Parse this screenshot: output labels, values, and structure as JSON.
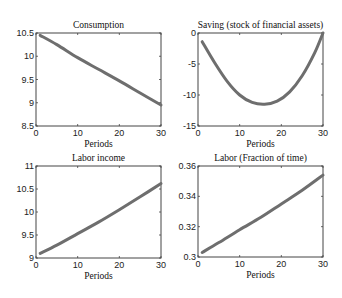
{
  "chart_data": [
    {
      "type": "line",
      "title": "Consumption",
      "xlabel": "Periods",
      "ylabel": "",
      "xlim": [
        0,
        30
      ],
      "ylim": [
        8.5,
        10.5
      ],
      "xticks": [
        0,
        10,
        20,
        30
      ],
      "yticks": [
        8.5,
        9,
        9.5,
        10,
        10.5
      ],
      "ytick_labels": [
        "8.5",
        "9",
        "9.5",
        "10",
        "10.5"
      ],
      "x": [
        1,
        5,
        10,
        15,
        20,
        25,
        30
      ],
      "values": [
        10.45,
        10.25,
        9.97,
        9.72,
        9.47,
        9.21,
        8.95
      ],
      "box": [
        36,
        33,
        161,
        126
      ]
    },
    {
      "type": "line",
      "title": "Saving (stock of financial assets)",
      "xlabel": "Periods",
      "ylabel": "",
      "xlim": [
        0,
        30
      ],
      "ylim": [
        -15,
        0
      ],
      "xticks": [
        0,
        10,
        20,
        30
      ],
      "yticks": [
        -15,
        -10,
        -5,
        0
      ],
      "ytick_labels": [
        "-15",
        "-10",
        "-5",
        "0"
      ],
      "x": [
        1,
        4,
        7,
        10,
        13,
        16,
        19,
        22,
        25,
        28,
        30
      ],
      "values": [
        -1.4,
        -4.8,
        -7.8,
        -10.0,
        -11.2,
        -11.5,
        -11.0,
        -9.5,
        -6.9,
        -3.2,
        0
      ],
      "box": [
        198,
        33,
        323,
        126
      ]
    },
    {
      "type": "line",
      "title": "Labor income",
      "xlabel": "Periods",
      "ylabel": "",
      "xlim": [
        0,
        30
      ],
      "ylim": [
        9,
        11
      ],
      "xticks": [
        0,
        10,
        20,
        30
      ],
      "yticks": [
        9,
        9.5,
        10,
        10.5,
        11
      ],
      "ytick_labels": [
        "9",
        "9.5",
        "10",
        "10.5",
        "11"
      ],
      "x": [
        1,
        5,
        10,
        15,
        20,
        25,
        30
      ],
      "values": [
        9.1,
        9.28,
        9.53,
        9.78,
        10.05,
        10.33,
        10.62
      ],
      "box": [
        36,
        166,
        161,
        258
      ]
    },
    {
      "type": "line",
      "title": "Labor (Fraction of time)",
      "xlabel": "Periods",
      "ylabel": "",
      "xlim": [
        0,
        30
      ],
      "ylim": [
        0.3,
        0.36
      ],
      "xticks": [
        0,
        10,
        20,
        30
      ],
      "yticks": [
        0.3,
        0.32,
        0.34,
        0.36
      ],
      "ytick_labels": [
        "0.3",
        "0.32",
        "0.34",
        "0.36"
      ],
      "x": [
        1,
        5,
        10,
        15,
        20,
        25,
        30
      ],
      "values": [
        0.303,
        0.3095,
        0.318,
        0.326,
        0.335,
        0.344,
        0.354
      ],
      "box": [
        198,
        166,
        323,
        257
      ]
    }
  ],
  "style": {
    "line_color": "#6e6e6e",
    "axis_color": "#444444"
  }
}
